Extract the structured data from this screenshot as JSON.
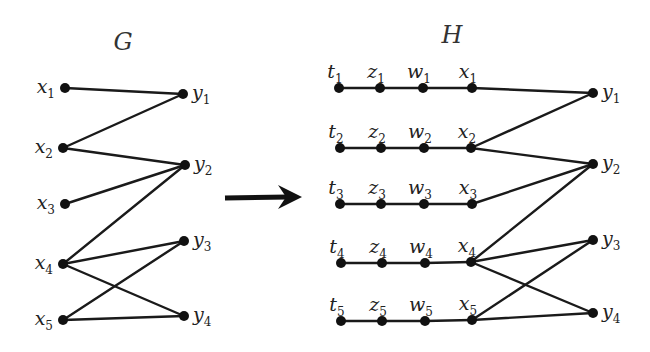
{
  "graphs": {
    "G": {
      "title": "G",
      "title_pos": [
        123,
        42
      ],
      "nodes": [
        {
          "id": "x1",
          "base": "x",
          "sub": "1",
          "x": 65,
          "y": 88,
          "label_side": "left"
        },
        {
          "id": "x2",
          "base": "x",
          "sub": "2",
          "x": 63,
          "y": 148,
          "label_side": "left"
        },
        {
          "id": "x3",
          "base": "x",
          "sub": "3",
          "x": 65,
          "y": 204,
          "label_side": "left"
        },
        {
          "id": "x4",
          "base": "x",
          "sub": "4",
          "x": 63,
          "y": 264,
          "label_side": "left"
        },
        {
          "id": "x5",
          "base": "x",
          "sub": "5",
          "x": 63,
          "y": 320,
          "label_side": "left"
        },
        {
          "id": "y1",
          "base": "y",
          "sub": "1",
          "x": 183,
          "y": 94,
          "label_side": "right"
        },
        {
          "id": "y2",
          "base": "y",
          "sub": "2",
          "x": 185,
          "y": 165,
          "label_side": "right"
        },
        {
          "id": "y3",
          "base": "y",
          "sub": "3",
          "x": 184,
          "y": 241,
          "label_side": "right"
        },
        {
          "id": "y4",
          "base": "y",
          "sub": "4",
          "x": 184,
          "y": 316,
          "label_side": "right"
        }
      ],
      "edges": [
        [
          "x1",
          "y1"
        ],
        [
          "x2",
          "y1"
        ],
        [
          "x2",
          "y2"
        ],
        [
          "x3",
          "y2"
        ],
        [
          "x4",
          "y2"
        ],
        [
          "x4",
          "y3"
        ],
        [
          "x4",
          "y4"
        ],
        [
          "x5",
          "y3"
        ],
        [
          "x5",
          "y4"
        ]
      ]
    },
    "H": {
      "title": "H",
      "title_pos": [
        452,
        35
      ],
      "nodes": [
        {
          "id": "t1",
          "base": "t",
          "sub": "1",
          "x": 339,
          "y": 88,
          "label_side": "top"
        },
        {
          "id": "z1",
          "base": "z",
          "sub": "1",
          "x": 380,
          "y": 88,
          "label_side": "top"
        },
        {
          "id": "w1",
          "base": "w",
          "sub": "1",
          "x": 423,
          "y": 88,
          "label_side": "top"
        },
        {
          "id": "x1",
          "base": "x",
          "sub": "1",
          "x": 472,
          "y": 88,
          "label_side": "top"
        },
        {
          "id": "t2",
          "base": "t",
          "sub": "2",
          "x": 340,
          "y": 148,
          "label_side": "top"
        },
        {
          "id": "z2",
          "base": "z",
          "sub": "2",
          "x": 381,
          "y": 148,
          "label_side": "top"
        },
        {
          "id": "w2",
          "base": "w",
          "sub": "2",
          "x": 424,
          "y": 148,
          "label_side": "top"
        },
        {
          "id": "x2",
          "base": "x",
          "sub": "2",
          "x": 471,
          "y": 148,
          "label_side": "top"
        },
        {
          "id": "t3",
          "base": "t",
          "sub": "3",
          "x": 340,
          "y": 204,
          "label_side": "top"
        },
        {
          "id": "z3",
          "base": "z",
          "sub": "3",
          "x": 381,
          "y": 204,
          "label_side": "top"
        },
        {
          "id": "w3",
          "base": "w",
          "sub": "3",
          "x": 424,
          "y": 204,
          "label_side": "top"
        },
        {
          "id": "x3",
          "base": "x",
          "sub": "3",
          "x": 472,
          "y": 204,
          "label_side": "top"
        },
        {
          "id": "t4",
          "base": "t",
          "sub": "4",
          "x": 341,
          "y": 263,
          "label_side": "top"
        },
        {
          "id": "z4",
          "base": "z",
          "sub": "4",
          "x": 382,
          "y": 263,
          "label_side": "top"
        },
        {
          "id": "w4",
          "base": "w",
          "sub": "4",
          "x": 425,
          "y": 263,
          "label_side": "top"
        },
        {
          "id": "x4",
          "base": "x",
          "sub": "4",
          "x": 471,
          "y": 262,
          "label_side": "top"
        },
        {
          "id": "t5",
          "base": "t",
          "sub": "5",
          "x": 341,
          "y": 321,
          "label_side": "top"
        },
        {
          "id": "z5",
          "base": "z",
          "sub": "5",
          "x": 382,
          "y": 321,
          "label_side": "top"
        },
        {
          "id": "w5",
          "base": "w",
          "sub": "5",
          "x": 425,
          "y": 321,
          "label_side": "top"
        },
        {
          "id": "x5",
          "base": "x",
          "sub": "5",
          "x": 472,
          "y": 320,
          "label_side": "top"
        },
        {
          "id": "y1",
          "base": "y",
          "sub": "1",
          "x": 593,
          "y": 93,
          "label_side": "right"
        },
        {
          "id": "y2",
          "base": "y",
          "sub": "2",
          "x": 593,
          "y": 164,
          "label_side": "right"
        },
        {
          "id": "y3",
          "base": "y",
          "sub": "3",
          "x": 593,
          "y": 240,
          "label_side": "right"
        },
        {
          "id": "y4",
          "base": "y",
          "sub": "4",
          "x": 593,
          "y": 313,
          "label_side": "right"
        }
      ],
      "edges": [
        [
          "t1",
          "z1"
        ],
        [
          "z1",
          "w1"
        ],
        [
          "w1",
          "x1"
        ],
        [
          "t2",
          "z2"
        ],
        [
          "z2",
          "w2"
        ],
        [
          "w2",
          "x2"
        ],
        [
          "t3",
          "z3"
        ],
        [
          "z3",
          "w3"
        ],
        [
          "w3",
          "x3"
        ],
        [
          "t4",
          "z4"
        ],
        [
          "z4",
          "w4"
        ],
        [
          "w4",
          "x4"
        ],
        [
          "t5",
          "z5"
        ],
        [
          "z5",
          "w5"
        ],
        [
          "w5",
          "x5"
        ],
        [
          "x1",
          "y1"
        ],
        [
          "x2",
          "y1"
        ],
        [
          "x2",
          "y2"
        ],
        [
          "x3",
          "y2"
        ],
        [
          "x4",
          "y2"
        ],
        [
          "x4",
          "y3"
        ],
        [
          "x4",
          "y4"
        ],
        [
          "x5",
          "y3"
        ],
        [
          "x5",
          "y4"
        ]
      ]
    }
  },
  "arrow": {
    "from": [
      225,
      198
    ],
    "to": [
      302,
      197
    ],
    "label": "transforms-to"
  },
  "colors": {
    "ink": "#111111",
    "background": "#ffffff"
  }
}
